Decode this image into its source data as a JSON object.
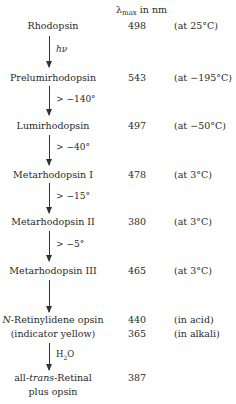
{
  "header": {
    "lambda_symbol": "λ",
    "lambda_sub": "max",
    "unit_label": "in nm"
  },
  "species": [
    {
      "name": "Rhodopsin",
      "lambda_max": "498",
      "condition": "(at 25°C)"
    },
    {
      "name": "Prelumirhodopsin",
      "lambda_max": "543",
      "condition": "(at −195°C)"
    },
    {
      "name": "Lumirhodopsin",
      "lambda_max": "497",
      "condition": "(at −50°C)"
    },
    {
      "name": "Metarhodopsin I",
      "lambda_max": "478",
      "condition": "(at 3°C)"
    },
    {
      "name": "Metarhodopsin II",
      "lambda_max": "380",
      "condition": "(at 3°C)"
    },
    {
      "name": "Metarhodopsin III",
      "lambda_max": "465",
      "condition": "(at 3°C)"
    },
    {
      "name_prefix": "N",
      "name": "-Retinylidene opsin",
      "lambda_max": "440",
      "condition": "(in acid)",
      "name2": "(indicator yellow)",
      "lambda_max2": "365",
      "condition2": "(in alkali)"
    },
    {
      "name_pre": "all-",
      "name_ital": "trans",
      "name": "-Retinal",
      "name2": "plus opsin",
      "lambda_max": "387"
    }
  ],
  "transitions": [
    {
      "label": "hν",
      "italic": true
    },
    {
      "label": "> −140°"
    },
    {
      "label": "> −40°"
    },
    {
      "label": "> −15°"
    },
    {
      "label": "> −5°"
    },
    {
      "label": ""
    },
    {
      "label_main": "H",
      "label_sub": "2",
      "label_tail": "O"
    }
  ]
}
